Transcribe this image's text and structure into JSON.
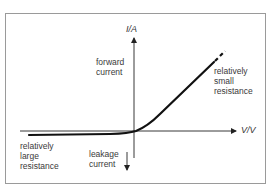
{
  "diagram": {
    "type": "diode I-V characteristic",
    "axes": {
      "y_label": "I/A",
      "x_label": "V/V"
    },
    "annotations": {
      "forward_current": "forward\ncurrent",
      "relatively_small_resistance": "relatively\nsmall\nresistance",
      "relatively_large_resistance": "relatively\nlarge\nresistance",
      "leakage_current": "leakage\ncurrent"
    },
    "colors": {
      "frame": "#9a9a9a",
      "curve": "#111111",
      "axis": "#222222",
      "text": "#3a3a3a"
    }
  }
}
